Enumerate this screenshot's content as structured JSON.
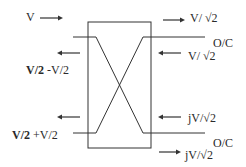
{
  "diagram": {
    "type": "hybrid-coupler-signal-flow",
    "box": {
      "x": 88,
      "y": 22,
      "w": 63,
      "h": 126
    },
    "left_labels": {
      "input_top": "V",
      "reflected_top_bold": "V/2",
      "reflected_top_rest": " -V/2",
      "reflected_bottom_bold": "V/2",
      "reflected_bottom_rest": " +V/2"
    },
    "right_labels": {
      "out_top_forward": "V/ √2",
      "port_top": "O/C",
      "out_top_return": "V/ √2",
      "out_bottom_return": "jV/√2",
      "port_bottom": "O/C",
      "out_bottom_forward": "jV/√2"
    },
    "colors": {
      "line": "#333333",
      "text": "#2a2a2a",
      "background": "#ffffff"
    }
  }
}
